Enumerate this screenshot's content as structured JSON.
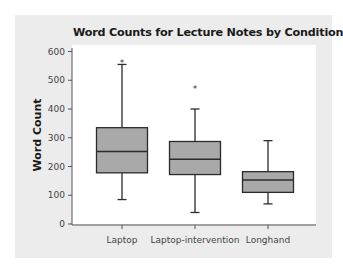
{
  "chart_data": {
    "type": "boxplot",
    "title": "Word Counts for Lecture Notes by Condition",
    "xlabel": "",
    "ylabel": "Word Count",
    "ylim": [
      0,
      600
    ],
    "yticks": [
      0,
      100,
      200,
      300,
      400,
      500,
      600
    ],
    "categories": [
      "Laptop",
      "Laptop-intervention",
      "Longhand"
    ],
    "series": [
      {
        "name": "Laptop",
        "whisker_low": 85,
        "q1": 178,
        "median": 252,
        "q3": 335,
        "whisker_high": 555,
        "outliers": [
          565
        ]
      },
      {
        "name": "Laptop-intervention",
        "whisker_low": 40,
        "q1": 172,
        "median": 225,
        "q3": 287,
        "whisker_high": 400,
        "outliers": [
          472
        ]
      },
      {
        "name": "Longhand",
        "whisker_low": 70,
        "q1": 110,
        "median": 153,
        "q3": 182,
        "whisker_high": 290,
        "outliers": []
      }
    ],
    "grid": false,
    "legend": null,
    "colors": {
      "box_fill": "#a9a9a9",
      "box_stroke": "#2b2b2b",
      "panel_bg": "#ececec",
      "plot_bg": "#ffffff"
    }
  }
}
